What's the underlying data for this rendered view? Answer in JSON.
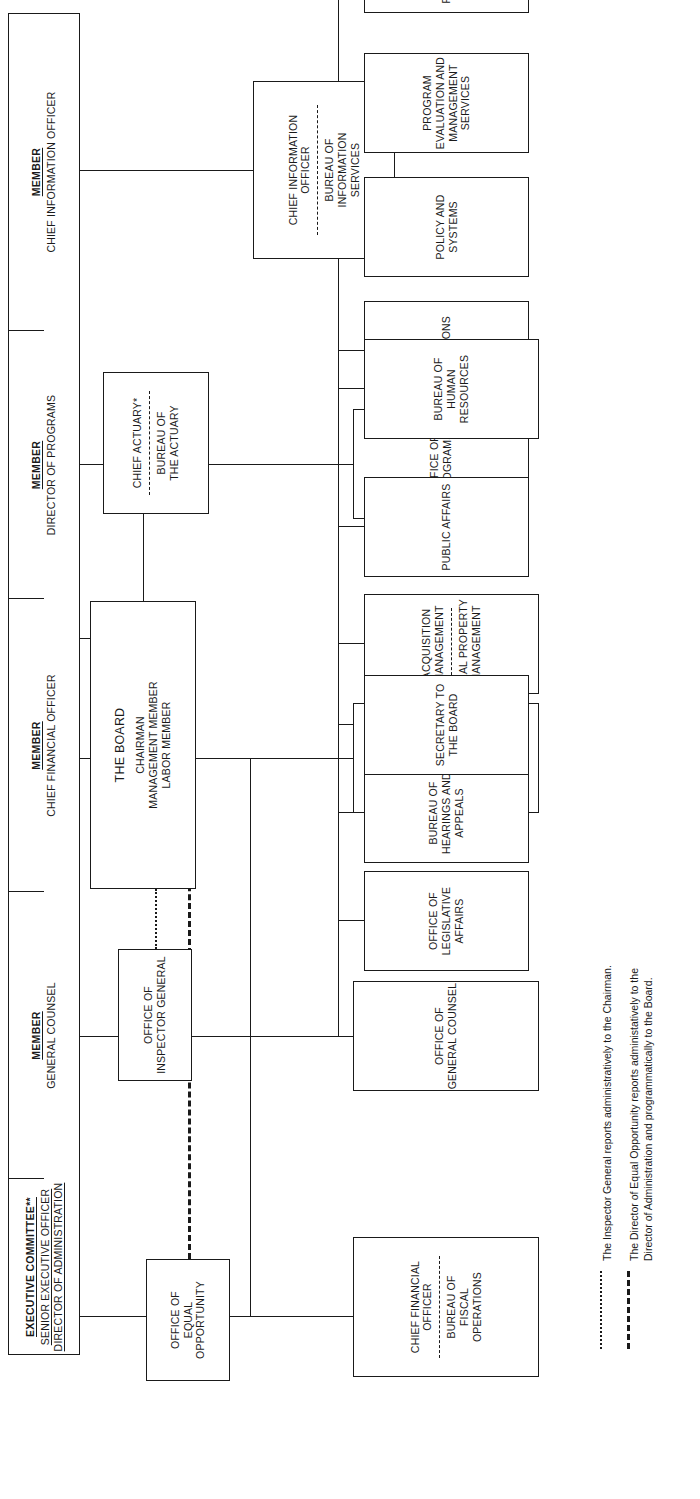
{
  "chart_title": "",
  "board": {
    "title": "THE BOARD",
    "members": "CHAIRMAN\nMANAGEMENT MEMBER\nLABOR MEMBER"
  },
  "actuary": {
    "top": "CHIEF ACTUARY*",
    "bottom": "BUREAU OF\nTHE ACTUARY"
  },
  "inspector_general": {
    "title": "OFFICE OF\nINSPECTOR GENERAL"
  },
  "equal_opportunity": {
    "title": "OFFICE OF\nEQUAL\nOPPORTUNITY"
  },
  "executive_committee": {
    "label": "EXECUTIVE COMMITTEE**",
    "line1": "SENIOR EXECUTIVE OFFICER",
    "line2": "DIRECTOR OF ADMINISTRATION"
  },
  "spine": {
    "member_word": "MEMBER",
    "cells": [
      {
        "label": "MEMBER",
        "role": "CHIEF INFORMATION OFFICER"
      },
      {
        "label": "MEMBER",
        "role": "DIRECTOR OF PROGRAMS"
      },
      {
        "label": "MEMBER",
        "role": "GENERAL COUNSEL"
      },
      {
        "label": "MEMBER",
        "role": "CHIEF FINANCIAL OFFICER"
      }
    ]
  },
  "columns": {
    "information": {
      "head_top": "CHIEF INFORMATION\nOFFICER",
      "head_bottom": "BUREAU OF\nINFORMATION\nSERVICES",
      "children": []
    },
    "programs": {
      "head": "OFFICE OF\nPROGRAMS",
      "children": [
        "OPERATIONS",
        "POLICY AND\nSYSTEMS",
        "PROGRAM\nEVALUATION AND\nMANAGEMENT\nSERVICES",
        "FIELD SERVICE"
      ]
    },
    "administration": {
      "head": "OFFICE OF\nADMINISTRATION",
      "children": [
        "PUBLIC AFFAIRS",
        "BUREAU OF\nHUMAN\nRESOURCES"
      ],
      "split_child": {
        "top": "ACQUISITION\nMANAGEMENT",
        "bottom": "REAL PROPERTY\nMANAGEMENT"
      }
    },
    "general_counsel": {
      "head": "OFFICE OF\nGENERAL COUNSEL",
      "children": [
        "OFFICE OF\nLEGISLATIVE\nAFFAIRS",
        "BUREAU OF\nHEARINGS AND\nAPPEALS",
        "SECRETARY TO\nTHE BOARD"
      ]
    },
    "financial": {
      "head_top": "CHIEF FINANCIAL\nOFFICER",
      "head_bottom": "BUREAU OF\nFISCAL\nOPERATIONS"
    }
  },
  "footnotes": [
    {
      "key": "dotted",
      "text": "The Inspector General reports administratively to the Chairman."
    },
    {
      "key": "dashed",
      "text": "The Director of Equal Opportunity reports administatively to the Director of Administration and programmatically to the Board."
    }
  ]
}
